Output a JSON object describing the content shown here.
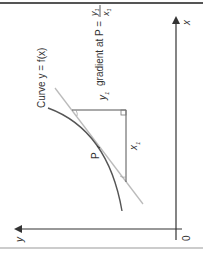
{
  "diagram": {
    "orientation": "rotated 90 degrees counter-clockwise",
    "title": "Curve y = f(x)",
    "curve_label": "Curve y = f(x)",
    "point_label": "P",
    "rise_label": "y",
    "rise_subscript": "1",
    "run_label": "x",
    "run_subscript": "1",
    "gradient_text": "gradient at P =",
    "gradient_numerator": "y",
    "gradient_numerator_subscript": "1",
    "gradient_denominator": "x",
    "gradient_denominator_subscript": "1",
    "x_axis_label": "x",
    "y_axis_label": "y",
    "origin_label": "0"
  },
  "colors": {
    "axis": "#333333",
    "curve": "#555555",
    "tangent": "#bbbbbb",
    "triangle": "#555555",
    "frame": "#777777",
    "text": "#333333"
  }
}
